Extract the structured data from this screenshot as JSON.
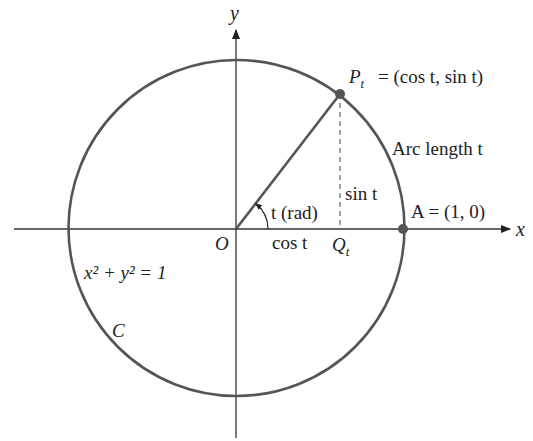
{
  "diagram": {
    "colors": {
      "circle": "#555555",
      "axes": "#333333",
      "radius": "#555555",
      "point": "#555555",
      "text": "#222222"
    },
    "labels": {
      "y_axis": "y",
      "x_axis": "x",
      "origin": "O",
      "point_p_main": "P",
      "point_p_sub": "t",
      "point_p_eq": "= (cos t, sin t)",
      "arc_length": "Arc length t",
      "sin_label": "sin t",
      "angle_label": "t (rad)",
      "cos_label": "cos t",
      "q_main": "Q",
      "q_sub": "t",
      "point_a": "A = (1, 0)",
      "equation": "x² + y² = 1",
      "curve_name": "C"
    }
  }
}
